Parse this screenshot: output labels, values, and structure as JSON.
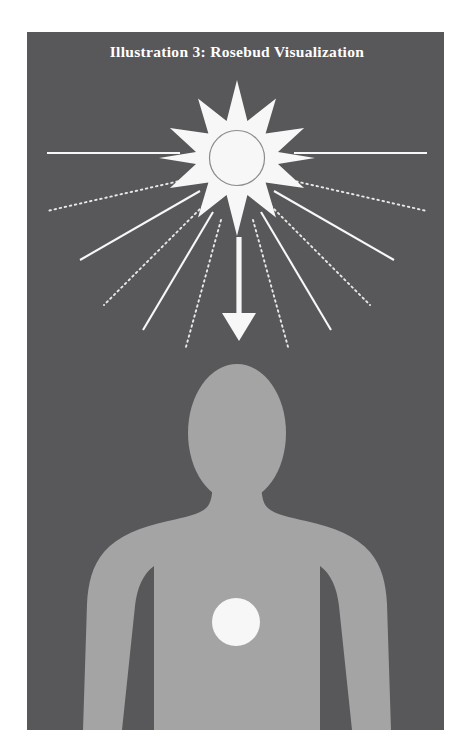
{
  "page": {
    "background_color": "#ffffff",
    "width": 470,
    "height": 756
  },
  "illustration": {
    "title": "Illustration 3:  Rosebud Visualization",
    "panel": {
      "x": 27,
      "y": 32,
      "width": 417,
      "height": 698,
      "background_color": "#58585a"
    },
    "colors": {
      "panel_background": "#58585a",
      "figure_body": "#a8a8a8",
      "light_white": "#ffffff",
      "circle_outline": "#8e8e90",
      "title_text": "#ffffff"
    },
    "elements": {
      "starburst": {
        "name": "radiant-starburst",
        "center_x": 237,
        "center_y": 158,
        "points": 12,
        "outer_radius": 78,
        "inner_radius": 40,
        "fill": "#ffffff",
        "inner_circle_radius": 27,
        "inner_circle_fill": "#ffffff",
        "inner_circle_stroke": "#8e8e90"
      },
      "rays": {
        "name": "light-rays",
        "count": 16,
        "solid_color": "#ffffff",
        "dotted_color": "#e8e8e8",
        "pattern": "alternating solid and dotted"
      },
      "arrow": {
        "name": "downward-energy-arrow",
        "from_x": 239,
        "from_y": 237,
        "to_x": 239,
        "to_y": 338,
        "color": "#ffffff",
        "direction": "down"
      },
      "human_figure": {
        "name": "human-silhouette",
        "fill": "#a8a8a8",
        "head_center_x": 237,
        "head_center_y": 432,
        "head_radius_x": 49,
        "head_radius_y": 69
      },
      "rosebud_circle": {
        "name": "rosebud-light-circle",
        "center_x": 236,
        "center_y": 622,
        "radius": 24,
        "fill": "#ffffff"
      }
    }
  }
}
